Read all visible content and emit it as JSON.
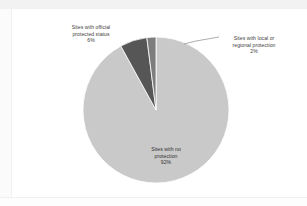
{
  "chart_data": {
    "type": "pie",
    "title": "",
    "subtitle": "",
    "xlabel": "",
    "ylabel": "",
    "legend_position": "none",
    "grid": false,
    "categories": [
      "Sites with no protection",
      "Sites with official protected status",
      "Sites with local or regional protection"
    ],
    "values": [
      92,
      6,
      2
    ],
    "unit": "%",
    "colors": [
      "#c9c9c9",
      "#565656",
      "#7d7d7d"
    ],
    "slices": [
      {
        "label": "Sites with no protection",
        "value": 92,
        "display": "92%",
        "color": "#c9c9c9",
        "label_placement": "inside-bottom"
      },
      {
        "label": "Sites with official protected status",
        "value": 6,
        "display": "6%",
        "color": "#565656",
        "label_placement": "outside-top-left"
      },
      {
        "label": "Sites with local or regional protection",
        "value": 2,
        "display": "2%",
        "color": "#7d7d7d",
        "label_placement": "outside-top-right-leader"
      }
    ],
    "start_angle_deg": 0,
    "direction": "clockwise"
  },
  "labels": {
    "official": {
      "line1": "Sites with official",
      "line2": "protected status",
      "pct": "6%"
    },
    "local": {
      "line1": "Sites with local or",
      "line2": "regional protection",
      "pct": "2%"
    },
    "none": {
      "line1": "Sites with no",
      "line2": "protection",
      "pct": "92%"
    }
  },
  "style": {
    "slice_no_protection": "#c9c9c9",
    "slice_official": "#565656",
    "slice_local": "#7d7d7d",
    "panel_background": "#ffffff",
    "text_color": "#3c3c3c",
    "leader_line_color": "#8a8a8a"
  }
}
